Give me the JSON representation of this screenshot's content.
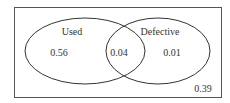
{
  "diagram": {
    "type": "venn",
    "sets": [
      {
        "name": "Used",
        "only_value": "0.56"
      },
      {
        "name": "Defective",
        "only_value": "0.01"
      }
    ],
    "intersection_value": "0.04",
    "outside_value": "0.39",
    "colors": {
      "stroke": "#333333",
      "background": "#ffffff"
    }
  }
}
